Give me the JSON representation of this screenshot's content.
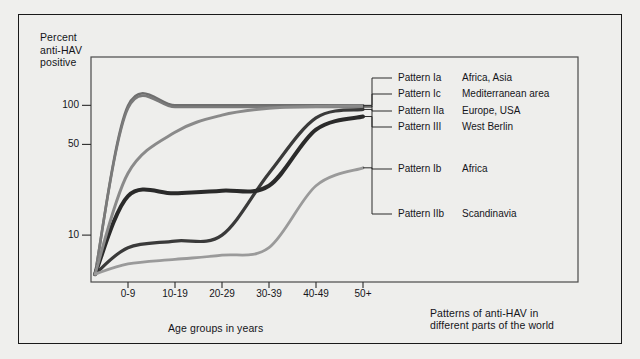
{
  "figure": {
    "caption": "Patterns of anti-HAV in\ndifferent parts of the world",
    "y_axis_title": "Percent\nanti-HAV\npositive",
    "x_axis_title": "Age groups in years",
    "background_color": "#efefed",
    "frame_color": "#1a1a1a"
  },
  "chart_data": {
    "type": "line",
    "title": "Patterns of anti-HAV in different parts of the world",
    "xlabel": "Age groups in years",
    "ylabel": "Percent anti-HAV positive",
    "x_scale": "categorical",
    "y_scale": "log",
    "ylim": [
      4,
      115
    ],
    "grid": false,
    "legend_position": "right",
    "categories": [
      "0-9",
      "10-19",
      "20-29",
      "30-39",
      "40-49",
      "50+"
    ],
    "y_ticks": [
      10,
      50,
      100
    ],
    "y_tick_labels": [
      "10",
      "50",
      "100"
    ],
    "series": [
      {
        "name": "Pattern Ia",
        "region": "Africa, Asia",
        "color": "#6e6e6e",
        "width": 2.6,
        "values": [
          99,
          100,
          100,
          100,
          100,
          100
        ],
        "start_value": 5
      },
      {
        "name": "Pattern Ic",
        "region": "Mediterranean area",
        "color": "#7a7a7a",
        "width": 2.6,
        "values": [
          95,
          97,
          97,
          97,
          97,
          97
        ],
        "start_value": 5
      },
      {
        "name": "Pattern IIa",
        "region": "Europe, USA",
        "color": "#3a3a3a",
        "width": 3.2,
        "values": [
          8,
          9,
          10,
          30,
          80,
          93
        ],
        "start_value": 5
      },
      {
        "name": "Pattern III",
        "region": "West Berlin",
        "color": "#2a2a2a",
        "width": 4.0,
        "values": [
          20,
          21,
          22,
          24,
          65,
          82
        ],
        "start_value": 5
      },
      {
        "name": "Pattern Ib",
        "region": "Africa",
        "color": "#8a8a8a",
        "width": 3.0,
        "values": [
          30,
          62,
          84,
          95,
          98,
          99
        ],
        "start_value": 5
      },
      {
        "name": "Pattern IIb",
        "region": "Scandinavia",
        "color": "#9a9a9a",
        "width": 2.8,
        "values": [
          6,
          6.5,
          7,
          8,
          24,
          33
        ],
        "start_value": 5
      }
    ]
  },
  "legend": {
    "entries": [
      {
        "pattern": "Pattern Ia",
        "region": "Africa, Asia"
      },
      {
        "pattern": "Pattern Ic",
        "region": "Mediterranean area"
      },
      {
        "pattern": "Pattern IIa",
        "region": "Europe, USA"
      },
      {
        "pattern": "Pattern III",
        "region": "West Berlin"
      },
      {
        "pattern": "Pattern Ib",
        "region": "Africa"
      },
      {
        "pattern": "Pattern IIb",
        "region": "Scandinavia"
      }
    ]
  }
}
